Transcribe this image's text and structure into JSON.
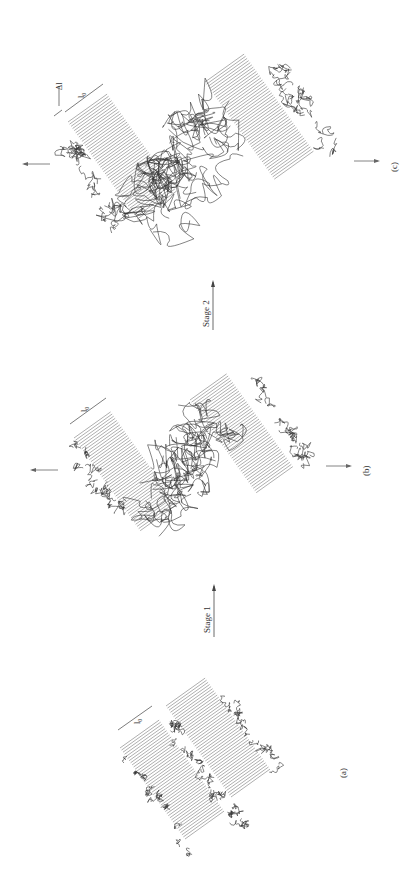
{
  "figure": {
    "orientation": "rotated-90-ccw",
    "panels": [
      {
        "id": "a",
        "label": "(a)",
        "dimension_labels": [
          "l₀"
        ]
      },
      {
        "id": "b",
        "label": "(b)",
        "dimension_labels": [
          "l₀"
        ]
      },
      {
        "id": "c",
        "label": "(c)",
        "dimension_labels": [
          "l₀",
          "Δl"
        ]
      }
    ],
    "transitions": [
      {
        "label": "Stage 1",
        "from": "a",
        "to": "b"
      },
      {
        "label": "Stage 2",
        "from": "b",
        "to": "c"
      }
    ],
    "colors": {
      "lines": "#555555",
      "text": "#333333",
      "background": "#ffffff"
    }
  }
}
